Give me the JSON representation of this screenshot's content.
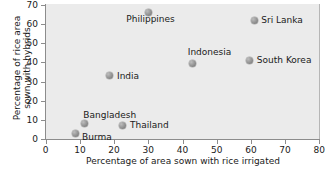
{
  "chart_data": {
    "type": "scatter",
    "title": "",
    "xlabel": "Percentage of area sown with rice irrigated",
    "ylabel_line1": "Percentage of rice area",
    "ylabel_line2": "sown with hybrids",
    "xlim": [
      0,
      80
    ],
    "ylim": [
      0,
      70
    ],
    "xticks": [
      0,
      10,
      20,
      30,
      40,
      50,
      60,
      70,
      80
    ],
    "yticks": [
      0,
      10,
      20,
      30,
      40,
      50,
      60,
      70
    ],
    "grid": false,
    "legend": "none",
    "marker_color": "#8f8f8f",
    "panel_color": "#ebebeb",
    "points": [
      {
        "label": "Burma",
        "x": 8.6,
        "y": 3.0,
        "label_dx": 7,
        "label_dy": 4
      },
      {
        "label": "Bangladesh",
        "x": 11.3,
        "y": 8.0,
        "label_dx": -1,
        "label_dy": -8
      },
      {
        "label": "India",
        "x": 18.8,
        "y": 33.0,
        "label_dx": 7,
        "label_dy": 1
      },
      {
        "label": "Thailand",
        "x": 22.6,
        "y": 7.3,
        "label_dx": 7,
        "label_dy": 1
      },
      {
        "label": "Philippines",
        "x": 30.0,
        "y": 66.0,
        "label_dx": -22,
        "label_dy": 8
      },
      {
        "label": "Indonesia",
        "x": 43.0,
        "y": 39.6,
        "label_dx": -5,
        "label_dy": -10
      },
      {
        "label": "South Korea",
        "x": 59.7,
        "y": 41.0,
        "label_dx": 7,
        "label_dy": 1
      },
      {
        "label": "Sri Lanka",
        "x": 61.0,
        "y": 62.0,
        "label_dx": 7,
        "label_dy": 1
      }
    ]
  }
}
